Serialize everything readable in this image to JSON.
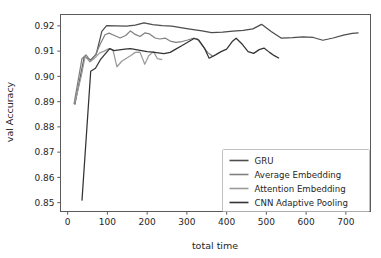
{
  "chart_data": {
    "type": "line",
    "title": "",
    "xlabel": "total time",
    "ylabel": "val Accuracy",
    "xlim": [
      -18,
      762
    ],
    "ylim": [
      0.8465,
      0.9245
    ],
    "xticks": [
      0,
      100,
      200,
      300,
      400,
      500,
      600,
      700
    ],
    "xtick_labels": [
      "0",
      "100",
      "200",
      "300",
      "400",
      "500",
      "600",
      "700"
    ],
    "yticks": [
      0.85,
      0.86,
      0.87,
      0.88,
      0.89,
      0.9,
      0.91,
      0.92
    ],
    "ytick_labels": [
      "0.85",
      "0.86",
      "0.87",
      "0.88",
      "0.89",
      "0.90",
      "0.91",
      "0.92"
    ],
    "grid": false,
    "legend_position": "lower right",
    "series": [
      {
        "name": "GRU",
        "color": "#4d4d4d",
        "points": [
          [
            18,
            0.8888
          ],
          [
            42,
            0.9078
          ],
          [
            58,
            0.9065
          ],
          [
            72,
            0.9088
          ],
          [
            86,
            0.9178
          ],
          [
            98,
            0.9201
          ],
          [
            122,
            0.92
          ],
          [
            148,
            0.9199
          ],
          [
            170,
            0.9203
          ],
          [
            192,
            0.9212
          ],
          [
            214,
            0.9205
          ],
          [
            238,
            0.9201
          ],
          [
            262,
            0.9199
          ],
          [
            288,
            0.9192
          ],
          [
            312,
            0.9186
          ],
          [
            338,
            0.918
          ],
          [
            362,
            0.9173
          ],
          [
            390,
            0.9175
          ],
          [
            416,
            0.9179
          ],
          [
            442,
            0.9182
          ],
          [
            466,
            0.9188
          ],
          [
            488,
            0.9206
          ],
          [
            512,
            0.9178
          ],
          [
            538,
            0.9151
          ],
          [
            566,
            0.9153
          ],
          [
            592,
            0.9156
          ],
          [
            618,
            0.9154
          ],
          [
            642,
            0.9143
          ],
          [
            668,
            0.9152
          ],
          [
            694,
            0.9163
          ],
          [
            716,
            0.917
          ],
          [
            732,
            0.9172
          ]
        ]
      },
      {
        "name": "Average Embedding",
        "color": "#808080",
        "points": [
          [
            16,
            0.889
          ],
          [
            36,
            0.907
          ],
          [
            46,
            0.9085
          ],
          [
            58,
            0.906
          ],
          [
            70,
            0.9085
          ],
          [
            82,
            0.9128
          ],
          [
            94,
            0.9165
          ],
          [
            104,
            0.9171
          ],
          [
            118,
            0.9162
          ],
          [
            132,
            0.9152
          ],
          [
            146,
            0.9162
          ],
          [
            158,
            0.918
          ],
          [
            170,
            0.9166
          ],
          [
            182,
            0.9158
          ],
          [
            194,
            0.9172
          ],
          [
            206,
            0.9168
          ],
          [
            220,
            0.9152
          ],
          [
            232,
            0.9148
          ],
          [
            246,
            0.9151
          ],
          [
            258,
            0.914
          ],
          [
            272,
            0.9135
          ],
          [
            288,
            0.9138
          ],
          [
            302,
            0.9144
          ],
          [
            316,
            0.9151
          ],
          [
            326,
            0.9149
          ],
          [
            340,
            0.912
          ],
          [
            352,
            0.9095
          ],
          [
            366,
            0.9078
          ]
        ]
      },
      {
        "name": "Attention Embedding",
        "color": "#9a9a9a",
        "points": [
          [
            18,
            0.8895
          ],
          [
            34,
            0.9
          ],
          [
            44,
            0.908
          ],
          [
            56,
            0.9058
          ],
          [
            68,
            0.9072
          ],
          [
            80,
            0.9092
          ],
          [
            92,
            0.91
          ],
          [
            104,
            0.911
          ],
          [
            114,
            0.9105
          ],
          [
            124,
            0.9038
          ],
          [
            136,
            0.906
          ],
          [
            148,
            0.9072
          ],
          [
            158,
            0.9082
          ],
          [
            170,
            0.9095
          ],
          [
            182,
            0.9096
          ],
          [
            194,
            0.9048
          ],
          [
            204,
            0.9082
          ],
          [
            216,
            0.9098
          ],
          [
            226,
            0.907
          ],
          [
            238,
            0.9066
          ]
        ]
      },
      {
        "name": "CNN Adaptive Pooling",
        "color": "#333333",
        "points": [
          [
            36,
            0.8508
          ],
          [
            58,
            0.902
          ],
          [
            70,
            0.9032
          ],
          [
            82,
            0.9065
          ],
          [
            94,
            0.9088
          ],
          [
            106,
            0.911
          ],
          [
            116,
            0.9102
          ],
          [
            130,
            0.9105
          ],
          [
            144,
            0.9108
          ],
          [
            158,
            0.911
          ],
          [
            172,
            0.9106
          ],
          [
            186,
            0.9102
          ],
          [
            200,
            0.9098
          ],
          [
            214,
            0.9096
          ],
          [
            228,
            0.9093
          ],
          [
            242,
            0.909
          ],
          [
            258,
            0.9095
          ],
          [
            272,
            0.9108
          ],
          [
            288,
            0.9122
          ],
          [
            302,
            0.9135
          ],
          [
            318,
            0.915
          ],
          [
            330,
            0.9144
          ],
          [
            344,
            0.9112
          ],
          [
            356,
            0.9072
          ],
          [
            372,
            0.9085
          ],
          [
            386,
            0.9098
          ],
          [
            400,
            0.9108
          ],
          [
            414,
            0.9138
          ],
          [
            424,
            0.9151
          ],
          [
            440,
            0.9126
          ],
          [
            454,
            0.9098
          ],
          [
            468,
            0.9091
          ],
          [
            482,
            0.9106
          ],
          [
            494,
            0.9112
          ],
          [
            508,
            0.9095
          ],
          [
            520,
            0.9082
          ],
          [
            532,
            0.9072
          ]
        ]
      }
    ]
  },
  "legend": {
    "items": [
      {
        "label": "GRU"
      },
      {
        "label": "Average Embedding"
      },
      {
        "label": "Attention Embedding"
      },
      {
        "label": "CNN Adaptive Pooling"
      }
    ]
  }
}
